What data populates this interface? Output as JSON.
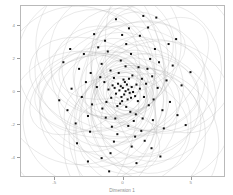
{
  "chart_data": {
    "type": "scatter",
    "title": "",
    "xlabel": "Dimension 1",
    "ylabel": "Dimension 2",
    "xlim": [
      -7.5,
      7.5
    ],
    "ylim": [
      -5.2,
      5.2
    ],
    "grid": false,
    "legend": null,
    "point_color": "#111111",
    "point_marker": "square",
    "point_size": 2.0,
    "ellipse_color": "#b0b0b0",
    "ellipse_opacity": 0.55,
    "frame_color": "#b9b9b9",
    "tick_label_color": "#8d8d8d",
    "xticks": [
      -5,
      0,
      5
    ],
    "xtick_labels": [
      "-5",
      "0",
      "5"
    ],
    "yticks": [
      -4,
      -2,
      0,
      2,
      4
    ],
    "ytick_labels": [
      "-4",
      "-2",
      "0",
      "2",
      "4"
    ],
    "points": [
      [
        -0.05,
        0.25
      ],
      [
        0.15,
        0.05
      ],
      [
        -0.2,
        0.35
      ],
      [
        0.35,
        0.15
      ],
      [
        0.05,
        -0.15
      ],
      [
        -0.3,
        0.1
      ],
      [
        0.25,
        0.45
      ],
      [
        -0.15,
        -0.3
      ],
      [
        0.45,
        -0.05
      ],
      [
        -0.4,
        0.5
      ],
      [
        0.1,
        0.6
      ],
      [
        -0.55,
        -0.1
      ],
      [
        0.6,
        0.3
      ],
      [
        -0.1,
        -0.55
      ],
      [
        0.3,
        -0.45
      ],
      [
        -0.65,
        0.25
      ],
      [
        0.55,
        -0.35
      ],
      [
        0.0,
        0.75
      ],
      [
        -0.25,
        -0.7
      ],
      [
        0.7,
        0.0
      ],
      [
        -0.8,
        0.4
      ],
      [
        0.4,
        0.8
      ],
      [
        0.85,
        -0.25
      ],
      [
        -0.45,
        -0.85
      ],
      [
        -0.9,
        -0.35
      ],
      [
        0.2,
        -0.9
      ],
      [
        0.95,
        0.45
      ],
      [
        -0.7,
        0.85
      ],
      [
        1.05,
        -0.55
      ],
      [
        -1.1,
        0.15
      ],
      [
        0.65,
        1.0
      ],
      [
        -0.35,
        1.15
      ],
      [
        1.2,
        0.2
      ],
      [
        -1.25,
        -0.6
      ],
      [
        0.5,
        -1.2
      ],
      [
        1.35,
        0.8
      ],
      [
        -0.95,
        1.3
      ],
      [
        -1.4,
        0.6
      ],
      [
        0.9,
        -1.35
      ],
      [
        1.5,
        -0.3
      ],
      [
        -1.55,
        -1.0
      ],
      [
        0.15,
        1.55
      ],
      [
        -0.6,
        -1.6
      ],
      [
        1.65,
        0.5
      ],
      [
        1.1,
        1.5
      ],
      [
        -1.7,
        0.9
      ],
      [
        0.75,
        -1.75
      ],
      [
        -1.3,
        -1.55
      ],
      [
        1.85,
        -0.8
      ],
      [
        -0.2,
        1.9
      ],
      [
        1.4,
        -1.6
      ],
      [
        -1.95,
        0.3
      ],
      [
        0.35,
        -2.05
      ],
      [
        2.1,
        0.95
      ],
      [
        -1.6,
        1.7
      ],
      [
        -0.85,
        -2.1
      ],
      [
        2.2,
        -0.45
      ],
      [
        1.75,
        1.4
      ],
      [
        -2.3,
        -0.75
      ],
      [
        0.55,
        2.3
      ],
      [
        -2.4,
        1.15
      ],
      [
        1.3,
        -2.35
      ],
      [
        2.5,
        0.25
      ],
      [
        -1.15,
        2.45
      ],
      [
        -0.45,
        -2.55
      ],
      [
        2.15,
        -1.7
      ],
      [
        -2.6,
        -1.45
      ],
      [
        1.95,
        2.0
      ],
      [
        0.85,
        -2.7
      ],
      [
        -2.75,
        0.6
      ],
      [
        2.85,
        -1.1
      ],
      [
        -1.85,
        2.7
      ],
      [
        0.2,
        2.9
      ],
      [
        2.6,
        1.8
      ],
      [
        -0.7,
        -3.0
      ],
      [
        -3.05,
        -0.3
      ],
      [
        1.55,
        -2.95
      ],
      [
        3.15,
        0.7
      ],
      [
        -2.45,
        -2.4
      ],
      [
        2.3,
        2.6
      ],
      [
        -3.25,
        1.4
      ],
      [
        0.6,
        -3.3
      ],
      [
        -1.35,
        3.1
      ],
      [
        3.4,
        -0.6
      ],
      [
        -0.1,
        3.45
      ],
      [
        2.95,
        -2.2
      ],
      [
        -3.5,
        -1.9
      ],
      [
        1.2,
        3.4
      ],
      [
        -2.9,
        2.3
      ],
      [
        3.6,
        1.6
      ],
      [
        -0.95,
        -3.7
      ],
      [
        2.05,
        -3.4
      ],
      [
        -3.8,
        0.2
      ],
      [
        0.4,
        3.85
      ],
      [
        3.95,
        -1.4
      ],
      [
        -2.15,
        3.5
      ],
      [
        1.8,
        3.9
      ],
      [
        -4.1,
        -1.1
      ],
      [
        3.3,
        2.9
      ],
      [
        -1.6,
        -4.0
      ],
      [
        4.25,
        0.4
      ],
      [
        -3.4,
        -3.1
      ],
      [
        0.95,
        -4.3
      ],
      [
        -4.4,
        1.8
      ],
      [
        2.7,
        -3.9
      ],
      [
        -0.55,
        4.4
      ],
      [
        4.55,
        -2.0
      ],
      [
        -2.6,
        -4.2
      ],
      [
        3.85,
        3.2
      ],
      [
        -4.7,
        -0.5
      ],
      [
        1.45,
        4.6
      ],
      [
        -3.9,
        2.6
      ],
      [
        4.9,
        1.2
      ],
      [
        -1.05,
        -4.8
      ],
      [
        2.4,
        4.5
      ]
    ],
    "ellipses": [
      {
        "cx": 0.0,
        "cy": 0.3,
        "rx": 1.2,
        "ry": 0.9,
        "angle": 15
      },
      {
        "cx": 0.2,
        "cy": -0.2,
        "rx": 1.5,
        "ry": 1.1,
        "angle": -30
      },
      {
        "cx": -0.4,
        "cy": 0.5,
        "rx": 1.8,
        "ry": 1.3,
        "angle": 55
      },
      {
        "cx": 0.5,
        "cy": 0.1,
        "rx": 2.0,
        "ry": 1.5,
        "angle": -10
      },
      {
        "cx": -0.2,
        "cy": -0.6,
        "rx": 2.2,
        "ry": 1.6,
        "angle": 80
      },
      {
        "cx": 0.6,
        "cy": 0.7,
        "rx": 2.4,
        "ry": 1.8,
        "angle": 25
      },
      {
        "cx": -0.7,
        "cy": 0.2,
        "rx": 2.6,
        "ry": 1.9,
        "angle": -55
      },
      {
        "cx": 0.3,
        "cy": -0.9,
        "rx": 2.8,
        "ry": 2.0,
        "angle": 40
      },
      {
        "cx": -0.9,
        "cy": 0.8,
        "rx": 3.0,
        "ry": 2.2,
        "angle": 70
      },
      {
        "cx": 1.0,
        "cy": -0.3,
        "rx": 3.2,
        "ry": 2.3,
        "angle": -25
      },
      {
        "cx": -0.3,
        "cy": 1.1,
        "rx": 3.4,
        "ry": 2.5,
        "angle": 10
      },
      {
        "cx": 1.2,
        "cy": 0.5,
        "rx": 3.5,
        "ry": 2.6,
        "angle": -70
      },
      {
        "cx": -1.3,
        "cy": -0.4,
        "rx": 3.6,
        "ry": 2.8,
        "angle": 50
      },
      {
        "cx": 0.4,
        "cy": -1.4,
        "rx": 3.8,
        "ry": 2.9,
        "angle": 85
      },
      {
        "cx": -1.5,
        "cy": 0.9,
        "rx": 3.9,
        "ry": 3.0,
        "angle": -40
      },
      {
        "cx": 1.6,
        "cy": -0.8,
        "rx": 4.0,
        "ry": 3.1,
        "angle": 20
      },
      {
        "cx": -0.6,
        "cy": 1.7,
        "rx": 4.1,
        "ry": 3.2,
        "angle": 65
      },
      {
        "cx": 1.8,
        "cy": 1.0,
        "rx": 4.2,
        "ry": 3.3,
        "angle": -15
      },
      {
        "cx": -1.9,
        "cy": -1.1,
        "rx": 4.3,
        "ry": 3.4,
        "angle": 35
      },
      {
        "cx": 0.7,
        "cy": -2.0,
        "rx": 4.4,
        "ry": 3.5,
        "angle": 75
      },
      {
        "cx": -2.1,
        "cy": 1.3,
        "rx": 4.5,
        "ry": 3.6,
        "angle": -60
      },
      {
        "cx": 2.2,
        "cy": -0.5,
        "rx": 4.6,
        "ry": 3.7,
        "angle": 5
      },
      {
        "cx": -0.8,
        "cy": 2.3,
        "rx": 4.7,
        "ry": 3.8,
        "angle": 45
      },
      {
        "cx": 2.4,
        "cy": 1.5,
        "rx": 4.8,
        "ry": 3.9,
        "angle": -35
      },
      {
        "cx": -2.5,
        "cy": -1.6,
        "rx": 4.9,
        "ry": 4.0,
        "angle": 60
      },
      {
        "cx": 1.0,
        "cy": -2.6,
        "rx": 5.0,
        "ry": 4.1,
        "angle": 30
      },
      {
        "cx": -2.7,
        "cy": 1.8,
        "rx": 5.1,
        "ry": 4.2,
        "angle": -20
      },
      {
        "cx": 2.8,
        "cy": -1.2,
        "rx": 5.2,
        "ry": 4.3,
        "angle": 78
      },
      {
        "cx": -1.1,
        "cy": 2.9,
        "rx": 5.3,
        "ry": 4.4,
        "angle": -50
      },
      {
        "cx": 3.0,
        "cy": 2.0,
        "rx": 5.4,
        "ry": 4.5,
        "angle": 12
      },
      {
        "cx": -3.1,
        "cy": -2.1,
        "rx": 5.5,
        "ry": 4.6,
        "angle": 52
      },
      {
        "cx": 1.3,
        "cy": -3.2,
        "rx": 5.6,
        "ry": 4.7,
        "angle": -65
      },
      {
        "cx": -3.3,
        "cy": 0.4,
        "rx": 5.7,
        "ry": 4.8,
        "angle": 22
      },
      {
        "cx": 0.9,
        "cy": 1.2,
        "rx": 2.1,
        "ry": 5.0,
        "angle": 8
      },
      {
        "cx": -1.2,
        "cy": -0.9,
        "rx": 2.3,
        "ry": 5.2,
        "angle": -8
      },
      {
        "cx": 0.1,
        "cy": 0.4,
        "rx": 5.8,
        "ry": 2.4,
        "angle": 88
      },
      {
        "cx": -0.5,
        "cy": -0.2,
        "rx": 6.0,
        "ry": 2.6,
        "angle": 3
      },
      {
        "cx": 1.5,
        "cy": 0.6,
        "rx": 3.1,
        "ry": 4.9,
        "angle": -45
      },
      {
        "cx": -1.8,
        "cy": 0.3,
        "rx": 3.3,
        "ry": 4.4,
        "angle": 68
      },
      {
        "cx": 0.2,
        "cy": -1.8,
        "rx": 4.6,
        "ry": 2.7,
        "angle": -12
      },
      {
        "cx": -0.1,
        "cy": 1.9,
        "rx": 4.8,
        "ry": 2.1,
        "angle": 18
      },
      {
        "cx": 2.0,
        "cy": -1.9,
        "rx": 3.7,
        "ry": 3.0,
        "angle": 42
      },
      {
        "cx": -2.2,
        "cy": -0.7,
        "rx": 3.5,
        "ry": 3.3,
        "angle": -72
      },
      {
        "cx": 0.8,
        "cy": 2.6,
        "rx": 2.9,
        "ry": 2.2,
        "angle": 28
      },
      {
        "cx": -0.4,
        "cy": -2.8,
        "rx": 3.2,
        "ry": 2.0,
        "angle": -28
      },
      {
        "cx": 2.6,
        "cy": 0.2,
        "rx": 2.5,
        "ry": 3.8,
        "angle": 58
      },
      {
        "cx": -2.9,
        "cy": 0.1,
        "rx": 2.7,
        "ry": 3.6,
        "angle": -58
      },
      {
        "cx": 0.0,
        "cy": 0.0,
        "rx": 6.2,
        "ry": 4.0,
        "angle": 0
      },
      {
        "cx": 0.3,
        "cy": -0.4,
        "rx": 1.0,
        "ry": 0.7,
        "angle": 33
      },
      {
        "cx": -0.2,
        "cy": 0.2,
        "rx": 0.8,
        "ry": 0.6,
        "angle": -33
      }
    ]
  }
}
